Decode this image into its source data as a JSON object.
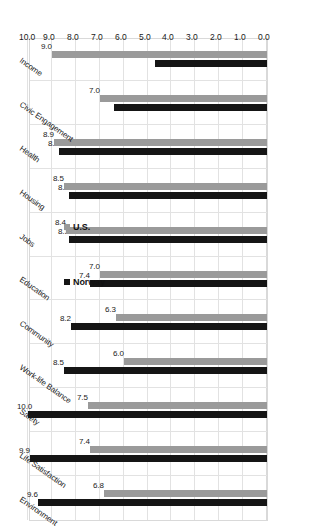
{
  "chart_data": {
    "type": "bar",
    "orientation": "horizontal-rotated",
    "title": "",
    "subtitle": "",
    "xlabel": "",
    "ylabel": "",
    "ylim": [
      0.0,
      10.0
    ],
    "grid": true,
    "legend_position": "middle-left",
    "tick_labels": [
      "10.0",
      "9.0",
      "8.0",
      "7.0",
      "6.0",
      "5.0",
      "4.0",
      "3.0",
      "2.0",
      "1.0",
      "0.0"
    ],
    "tick_values": [
      10.0,
      9.0,
      8.0,
      7.0,
      6.0,
      5.0,
      4.0,
      3.0,
      2.0,
      1.0,
      0.0
    ],
    "categories": [
      "Environment",
      "Life Satisfaction",
      "Safety",
      "Work-life Balance",
      "Community",
      "Education",
      "Jobs",
      "Housing",
      "Health",
      "Civic Engagement",
      "Income"
    ],
    "series": [
      {
        "name": "Norway",
        "color": "#151515",
        "values": [
          9.6,
          9.9,
          10.0,
          8.5,
          8.2,
          7.4,
          8.3,
          8.3,
          8.7,
          6.4,
          4.7
        ],
        "labels": [
          "9.6",
          "9.9",
          "10.0",
          "8.5",
          "8.2",
          "7.4",
          "8.3",
          "8.3",
          "8.7",
          "6.4",
          "4.7"
        ]
      },
      {
        "name": "U.S.",
        "color": "#9a9a9a",
        "values": [
          6.8,
          7.4,
          7.5,
          6.0,
          6.3,
          7.0,
          8.4,
          8.5,
          8.9,
          7.0,
          9.0
        ],
        "labels": [
          "6.8",
          "7.4",
          "7.5",
          "6.0",
          "6.3",
          "7.0",
          "8.4",
          "8.5",
          "8.9",
          "7.0",
          "9.0"
        ]
      }
    ]
  },
  "legend": {
    "entries": [
      {
        "label": "Norway",
        "color": "#151515"
      },
      {
        "label": "U.S.",
        "color": "#9a9a9a"
      }
    ]
  },
  "colors": {
    "norway": "#151515",
    "us": "#9a9a9a",
    "grid": "#e2e2e2",
    "axis": "#d9d9d9",
    "background": "#ffffff",
    "text": "#1a1a1a"
  }
}
